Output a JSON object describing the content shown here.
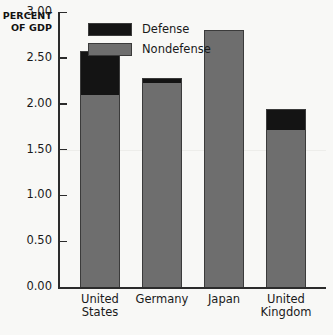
{
  "chart_data": {
    "type": "bar",
    "stacked": true,
    "title": "",
    "subtitle": "",
    "xlabel": "",
    "ylabel": "PERCENT\nOF GDP",
    "categories": [
      "United\nStates",
      "Germany",
      "Japan",
      "United\nKingdom"
    ],
    "category_names": [
      "United States",
      "Germany",
      "Japan",
      "United Kingdom"
    ],
    "series": [
      {
        "name": "Nondefense",
        "color": "#6e6e6e",
        "values": [
          2.1,
          2.23,
          2.8,
          1.71
        ]
      },
      {
        "name": "Defense",
        "color": "#141414",
        "values": [
          0.47,
          0.05,
          0.0,
          0.23
        ]
      }
    ],
    "totals": [
      2.57,
      2.28,
      2.8,
      1.94
    ],
    "ylim": [
      0.0,
      3.0
    ],
    "ytick_values": [
      3.0,
      2.5,
      2.0,
      1.5,
      1.0,
      0.5,
      0.0
    ],
    "ytick_labels": [
      "3.00",
      "2.50",
      "2.00",
      "1.50",
      "1.00",
      "0.50",
      "0.00"
    ],
    "grid": false,
    "legend_position": "top-center",
    "legend_entries": [
      "Defense",
      "Nondefense"
    ]
  },
  "legend": {
    "items": [
      {
        "label": "Defense",
        "color": "#141414"
      },
      {
        "label": "Nondefense",
        "color": "#6e6e6e"
      }
    ]
  },
  "axis": {
    "y_title": "PERCENT\nOF GDP"
  }
}
